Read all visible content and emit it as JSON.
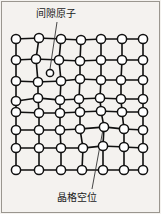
{
  "figure": {
    "kind": "crystal-lattice-defect-diagram",
    "background_color": "#f4f2ef",
    "border_color": "#9a968f",
    "atom_fill": "#ffffff",
    "atom_stroke": "#111111",
    "bond_color": "#111111",
    "leader_color": "#333333"
  },
  "labels": {
    "interstitial": "间隙原子",
    "vacancy": "晶格空位"
  },
  "lattice": {
    "columns": 7,
    "rows": 8,
    "atom_radius": 4.6,
    "interstitial_radius": 3.6,
    "nodes": [
      [
        {
          "id": "r0c0",
          "x": 16,
          "y": 39
        },
        {
          "id": "r0c1",
          "x": 39,
          "y": 38
        },
        {
          "id": "r0c2",
          "x": 61,
          "y": 39
        },
        {
          "id": "r0c3",
          "x": 81,
          "y": 40
        },
        {
          "id": "r0c4",
          "x": 101,
          "y": 39
        },
        {
          "id": "r0c5",
          "x": 122,
          "y": 39
        },
        {
          "id": "r0c6",
          "x": 143,
          "y": 39
        }
      ],
      [
        {
          "id": "r1c0",
          "x": 16,
          "y": 60
        },
        {
          "id": "r1c1",
          "x": 36,
          "y": 59
        },
        {
          "id": "r1c2",
          "x": 59,
          "y": 60
        },
        {
          "id": "r1c3",
          "x": 80,
          "y": 61
        },
        {
          "id": "r1c4",
          "x": 101,
          "y": 60
        },
        {
          "id": "r1c5",
          "x": 122,
          "y": 60
        },
        {
          "id": "r1c6",
          "x": 143,
          "y": 60
        }
      ],
      [
        {
          "id": "r2c0",
          "x": 16,
          "y": 81
        },
        {
          "id": "r2c1",
          "x": 38,
          "y": 82
        },
        {
          "id": "r2c2",
          "x": 61,
          "y": 81
        },
        {
          "id": "r2c3",
          "x": 80,
          "y": 79
        },
        {
          "id": "r2c4",
          "x": 101,
          "y": 80
        },
        {
          "id": "r2c5",
          "x": 121,
          "y": 80
        },
        {
          "id": "r2c6",
          "x": 143,
          "y": 80
        }
      ],
      [
        {
          "id": "r3c0",
          "x": 16,
          "y": 101
        },
        {
          "id": "r3c1",
          "x": 38,
          "y": 98
        },
        {
          "id": "r3c2",
          "x": 60,
          "y": 100
        },
        {
          "id": "r3c3",
          "x": 79,
          "y": 99
        },
        {
          "id": "r3c4",
          "x": 100,
          "y": 98
        },
        {
          "id": "r3c5",
          "x": 121,
          "y": 99
        },
        {
          "id": "r3c6",
          "x": 143,
          "y": 99
        }
      ],
      [
        {
          "id": "r4c0",
          "x": 16,
          "y": 112
        },
        {
          "id": "r4c1",
          "x": 39,
          "y": 113
        },
        {
          "id": "r4c2",
          "x": 60,
          "y": 113
        },
        {
          "id": "r4c3",
          "x": 80,
          "y": 112
        },
        {
          "id": "r4c4",
          "x": 101,
          "y": 111
        },
        {
          "id": "r4c5",
          "x": 122,
          "y": 112
        },
        {
          "id": "r4c6",
          "x": 143,
          "y": 112
        }
      ],
      [
        {
          "id": "r5c0",
          "x": 16,
          "y": 130
        },
        {
          "id": "r5c1",
          "x": 39,
          "y": 130
        },
        {
          "id": "r5c2",
          "x": 60,
          "y": 130
        },
        {
          "id": "r5c3",
          "x": 80,
          "y": 129
        },
        {
          "id": "r5c4",
          "x": 104,
          "y": 127
        },
        {
          "id": "r5c5",
          "x": 124,
          "y": 129
        },
        {
          "id": "r5c6",
          "x": 143,
          "y": 130
        }
      ],
      [
        {
          "id": "r6c0",
          "x": 16,
          "y": 148
        },
        {
          "id": "r6c1",
          "x": 39,
          "y": 148
        },
        {
          "id": "r6c2",
          "x": 61,
          "y": 148
        },
        {
          "id": "r6c3",
          "x": 83,
          "y": 148
        },
        {
          "id": "r6c4",
          "x": 103,
          "y": 146
        },
        {
          "id": "r6c5",
          "x": 124,
          "y": 147
        },
        {
          "id": "r6c6",
          "x": 143,
          "y": 148
        }
      ],
      [
        {
          "id": "r7c0",
          "x": 16,
          "y": 170
        },
        {
          "id": "r7c1",
          "x": 39,
          "y": 170
        },
        {
          "id": "r7c2",
          "x": 61,
          "y": 170
        },
        {
          "id": "r7c3",
          "x": 82,
          "y": 170
        },
        {
          "id": "r7c4",
          "x": 103,
          "y": 170
        },
        {
          "id": "r7c5",
          "x": 124,
          "y": 170
        },
        {
          "id": "r7c6",
          "x": 143,
          "y": 170
        }
      ]
    ]
  },
  "defects": {
    "interstitial_atom": {
      "x": 50,
      "y": 73,
      "r": 3.6
    },
    "vacancy_site": {
      "x": 103,
      "y": 129
    }
  },
  "leaders": {
    "interstitial_line": {
      "x1": 57,
      "y1": 22,
      "x2": 50,
      "y2": 69
    },
    "vacancy_line": {
      "x1": 92,
      "y1": 189,
      "x2": 104,
      "y2": 124
    }
  }
}
